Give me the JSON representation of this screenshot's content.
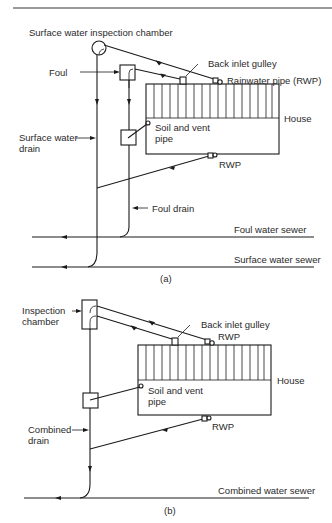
{
  "figure": {
    "panel_a": {
      "caption": "(a)",
      "labels": {
        "sw_inspection_chamber": "Surface water inspection chamber",
        "back_inlet_gulley": "Back inlet gulley",
        "foul": "Foul",
        "rainwater_pipe": "Rainwater pipe (RWP)",
        "house": "House",
        "surface_water_drain_1": "Surface water",
        "surface_water_drain_2": "drain",
        "soil_vent_pipe_1": "Soil and vent",
        "soil_vent_pipe_2": "pipe",
        "rwp_lower": "RWP",
        "foul_drain": "Foul drain",
        "foul_water_sewer": "Foul water sewer",
        "surface_water_sewer": "Surface water sewer"
      }
    },
    "panel_b": {
      "caption": "(b)",
      "labels": {
        "inspection_chamber_1": "Inspection",
        "inspection_chamber_2": "chamber",
        "back_inlet_gulley": "Back inlet gulley",
        "rwp_upper": "RWP",
        "house": "House",
        "soil_vent_pipe_1": "Soil and vent",
        "soil_vent_pipe_2": "pipe",
        "combined_drain_1": "Combined",
        "combined_drain_2": "drain",
        "rwp_lower": "RWP",
        "combined_water_sewer": "Combined water sewer"
      }
    }
  },
  "colors": {
    "line": "#1a1a1a",
    "text": "#2a2a2a",
    "rule": "#9a9a9a",
    "background": "#ffffff"
  }
}
